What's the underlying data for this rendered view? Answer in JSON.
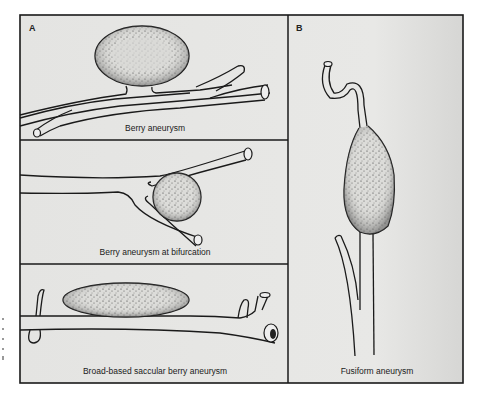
{
  "figure": {
    "panels": [
      {
        "id": "A",
        "label": "A"
      },
      {
        "id": "B",
        "label": "B"
      }
    ],
    "captions": {
      "berry": "Berry aneurysm",
      "bifurcation": "Berry aneurysm at bifurcation",
      "broad_based": "Broad-based saccular berry aneurysm",
      "fusiform": "Fusiform aneurysm"
    },
    "colors": {
      "background": "#e6e6e4",
      "line": "#1a1a1a",
      "sac_fill": "#d9d9d6",
      "stipple": "#333333"
    }
  }
}
